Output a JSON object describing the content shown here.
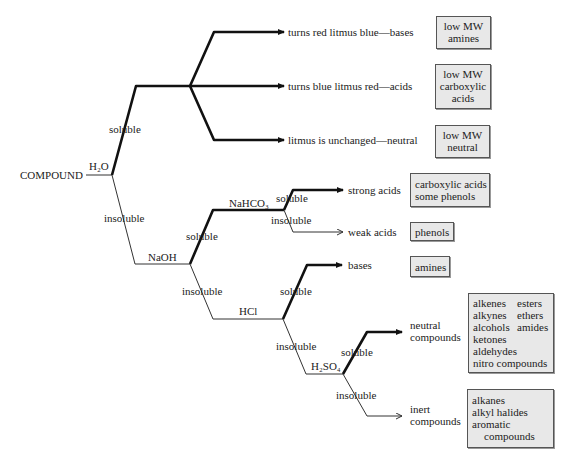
{
  "diagram": {
    "root": "COMPOUND",
    "reagents": {
      "h2o": "H₂O",
      "naoh": "NaOH",
      "nahco3": "NaHCO₃",
      "hcl": "HCl",
      "h2so4": "H₂SO₄"
    },
    "branch_labels": {
      "h2o_soluble": "soluble",
      "h2o_insoluble": "insoluble",
      "naoh_soluble": "soluble",
      "naoh_insoluble": "insoluble",
      "nahco3_soluble": "soluble",
      "nahco3_insoluble": "insoluble",
      "hcl_soluble": "soluble",
      "hcl_insoluble": "insoluble",
      "h2so4_soluble": "soluble",
      "h2so4_insoluble": "insoluble"
    },
    "outcomes": {
      "litmus_bases": "turns red litmus blue—bases",
      "litmus_acids": "turns blue litmus red—acids",
      "litmus_neutral": "litmus is unchanged—neutral",
      "strong_acids": "strong acids",
      "weak_acids": "weak acids",
      "bases": "bases",
      "neutral_line1": "neutral",
      "neutral_line2": "compounds",
      "inert_line1": "inert",
      "inert_line2": "compounds"
    },
    "boxes": {
      "lowmw_amines": [
        "low MW",
        "amines"
      ],
      "lowmw_acids": [
        "low MW",
        "carboxylic",
        "acids"
      ],
      "lowmw_neutral": [
        "low MW",
        "neutral"
      ],
      "carboxylic_phenols": [
        "carboxylic acids",
        "some phenols"
      ],
      "phenols": [
        "phenols"
      ],
      "amines": [
        "amines"
      ],
      "neutral_compounds": {
        "col1": [
          "alkenes",
          "alkynes",
          "alcohols",
          "ketones",
          "aldehydes"
        ],
        "col2": [
          "esters",
          "ethers",
          "amides"
        ],
        "wide": "nitro compounds"
      },
      "inert_compounds": [
        "alkanes",
        "alkyl halides",
        "aromatic",
        "compounds"
      ]
    },
    "colors": {
      "box_fill": "#e8e8e8",
      "box_border": "#555555",
      "line": "#111111"
    }
  }
}
